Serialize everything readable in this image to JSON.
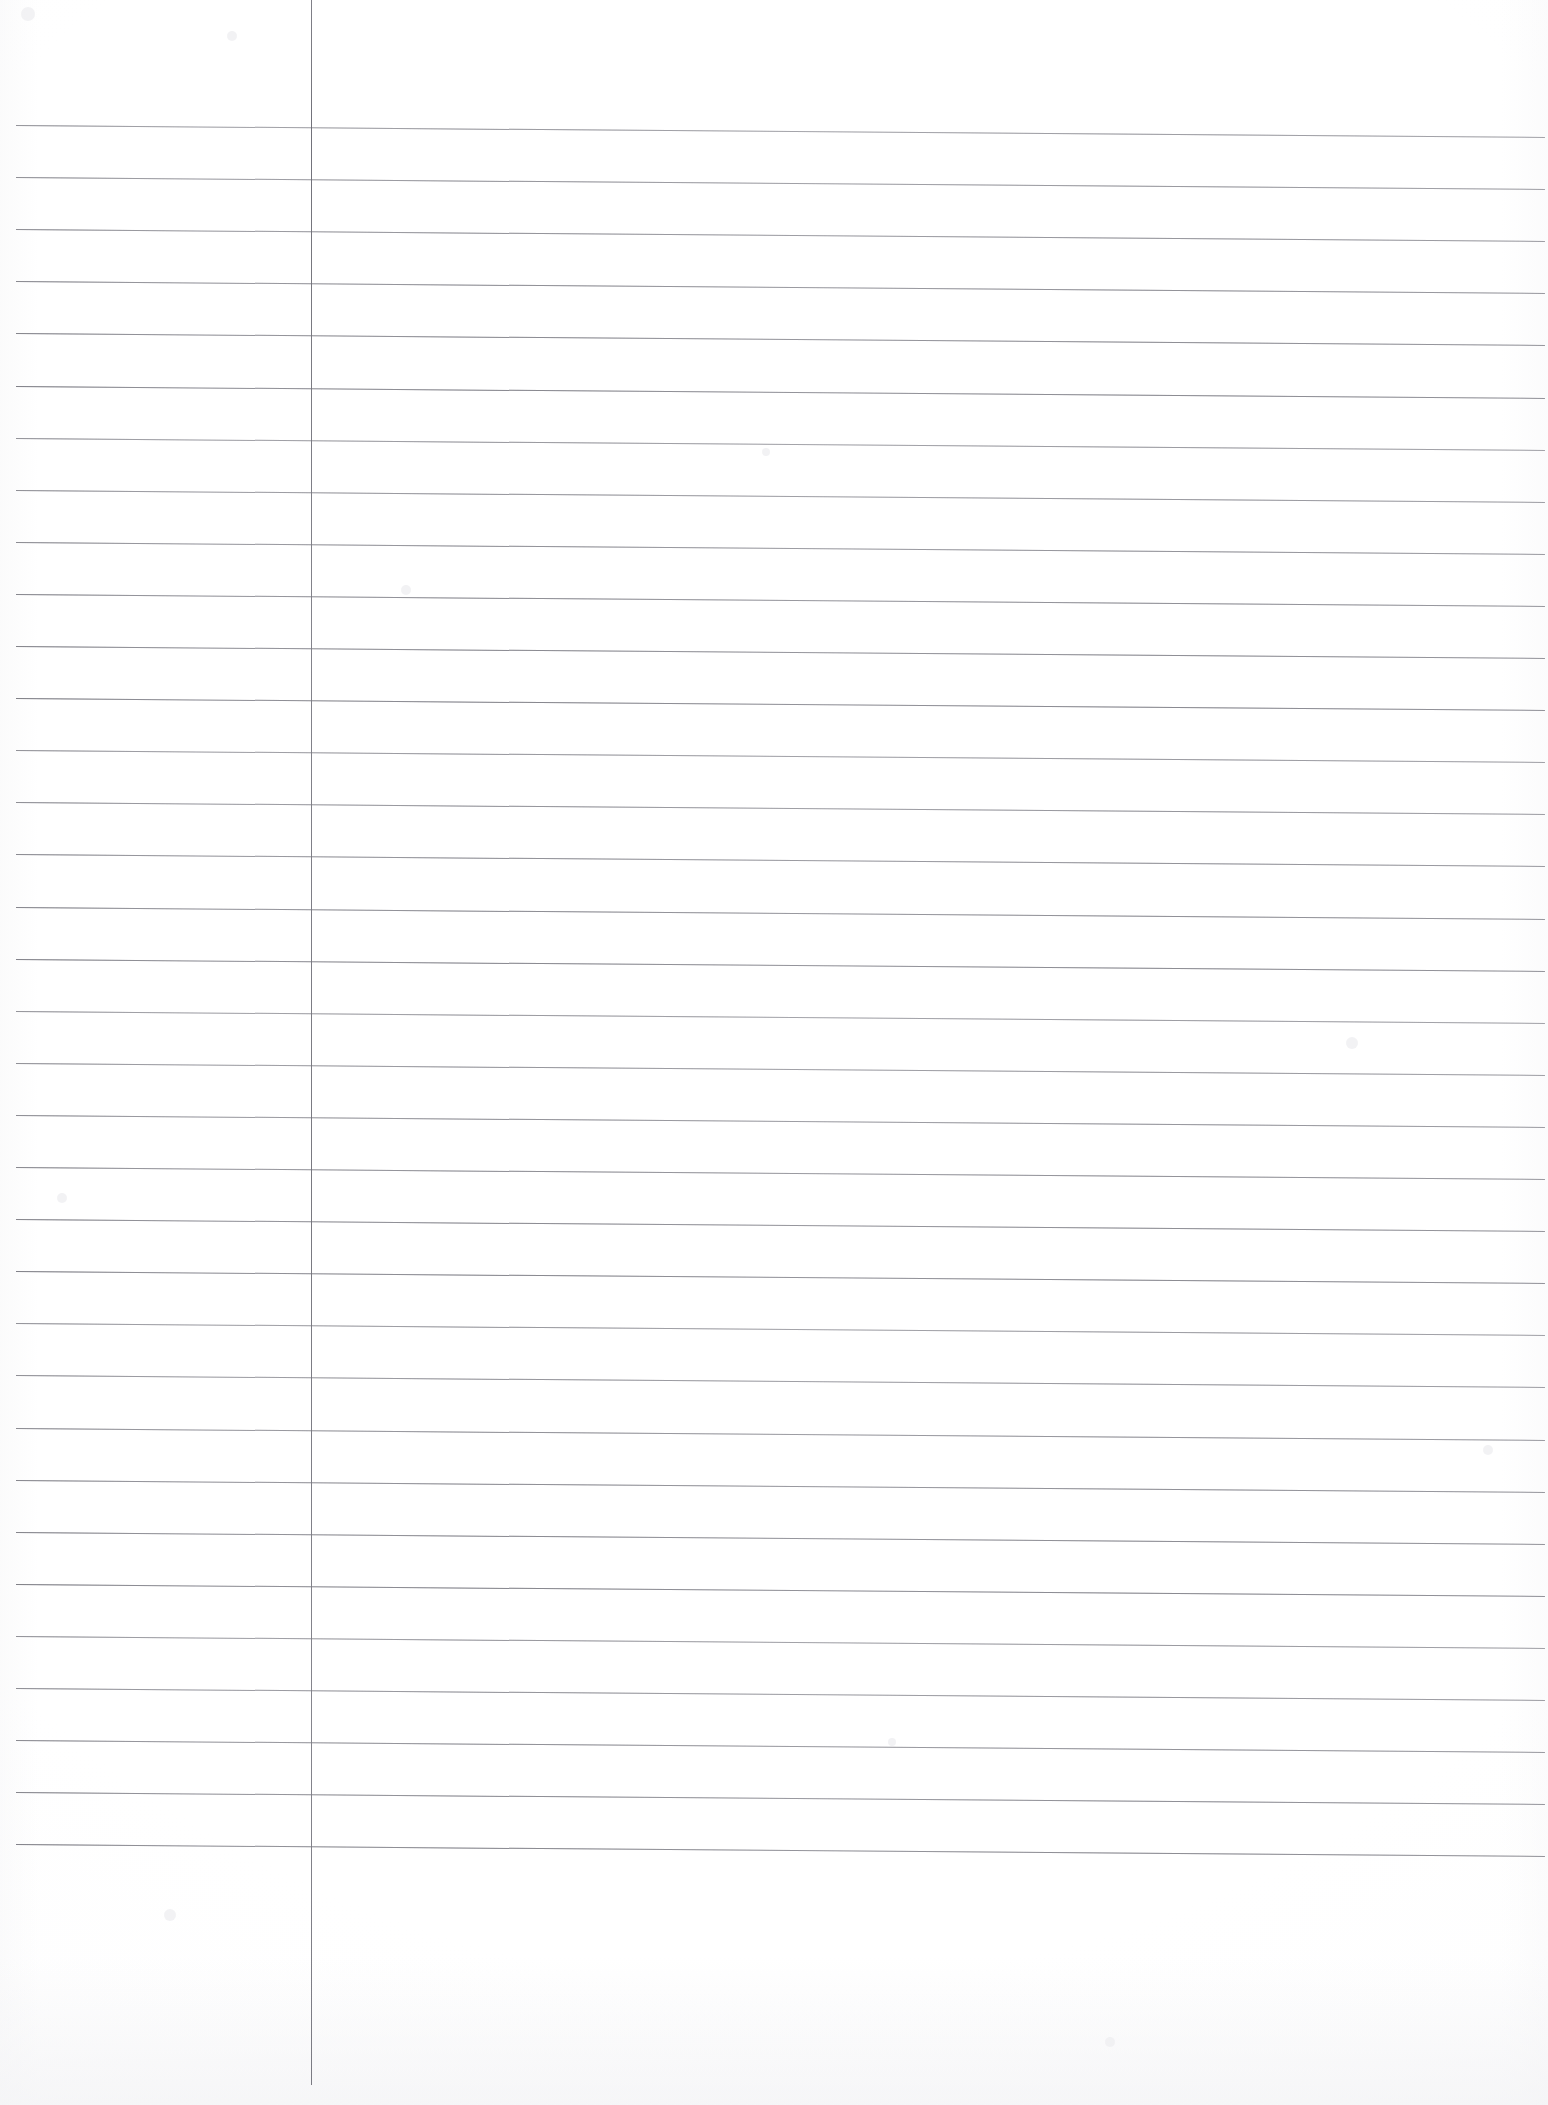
{
  "document": {
    "type": "lined-notebook-page",
    "title": "Blank ruled notebook page",
    "content_text": "",
    "page_width": 1548,
    "page_height": 2105,
    "paper_color": "#fdfdfd",
    "is_blank": true,
    "handwriting_present": false
  },
  "ruling": {
    "horizontal": {
      "count": 34,
      "color": "#8b8b92",
      "thickness_px": 1,
      "first_line_y": 125,
      "spacing_px": 52.1,
      "left_x": 16,
      "right_x": 1545,
      "slope_drop_px": 12
    },
    "vertical_margin": {
      "count": 1,
      "color": "#7c7c84",
      "thickness_px": 1,
      "x": 311,
      "top_y": 0,
      "bottom_y": 2085
    }
  },
  "specks": [
    {
      "x": 28,
      "y": 14,
      "r": 7
    },
    {
      "x": 232,
      "y": 36,
      "r": 5
    },
    {
      "x": 766,
      "y": 452,
      "r": 4
    },
    {
      "x": 406,
      "y": 590,
      "r": 5
    },
    {
      "x": 1352,
      "y": 1043,
      "r": 6
    },
    {
      "x": 62,
      "y": 1198,
      "r": 5
    },
    {
      "x": 1488,
      "y": 1450,
      "r": 5
    },
    {
      "x": 892,
      "y": 1742,
      "r": 4
    },
    {
      "x": 170,
      "y": 1915,
      "r": 6
    },
    {
      "x": 1110,
      "y": 2042,
      "r": 5
    }
  ]
}
